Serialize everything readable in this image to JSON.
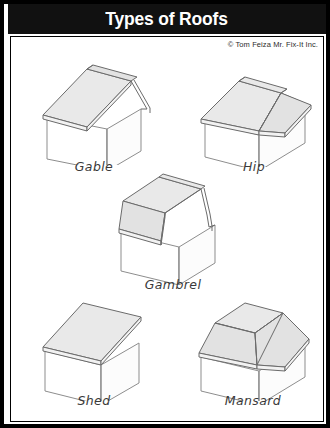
{
  "title": "Types of Roofs",
  "credit": "© Tom Feiza Mr. Fix-It Inc.",
  "colors": {
    "frame": "#000000",
    "title_bar": "#111111",
    "title_text": "#ffffff",
    "roof_fill": "#e9e9e9",
    "wall_fill": "#ffffff",
    "outline": "#6b6b6b",
    "caption_text": "#3a3a3a",
    "panel_background": "#ffffff"
  },
  "diagram": {
    "type": "illustration-grid",
    "columns": 2,
    "rows": 3
  },
  "roofs": [
    {
      "id": "gable",
      "label": "Gable",
      "position": "row-1-left",
      "description": "Two sloping roof planes meeting at a central ridge with triangular gable ends and overhanging rake."
    },
    {
      "id": "hip",
      "label": "Hip",
      "position": "row-1-right",
      "description": "Roof slopes downward on all four sides to the walls, meeting at a short central ridge."
    },
    {
      "id": "gambrel",
      "label": "Gambrel",
      "position": "row-2-center",
      "description": "Barn-style roof with two different slopes on each side; shallow upper pitch and steep lower pitch."
    },
    {
      "id": "shed",
      "label": "Shed",
      "position": "row-3-left",
      "description": "Single flat roof plane sloping in one direction from a high wall to a low wall."
    },
    {
      "id": "mansard",
      "label": "Mansard",
      "position": "row-3-right",
      "description": "Flat top deck surrounded by steep sloping sides on all four edges."
    }
  ]
}
